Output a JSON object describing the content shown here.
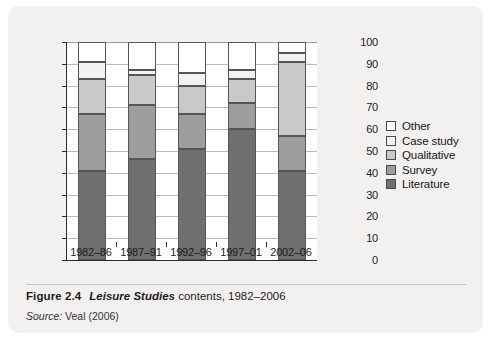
{
  "caption": {
    "number": "Figure 2.4",
    "title_italic": "Leisure Studies",
    "title_rest": " contents, 1982–2006",
    "source_label": "Source:",
    "source_text": " Veal (2006)"
  },
  "colors": {
    "other": "#ffffff",
    "case_study": "#f2f2f2",
    "qualitative": "#c9c9c9",
    "survey": "#9d9d9d",
    "literature": "#6f6f6f",
    "axis": "#2b2b2b",
    "grid": "#b9b9b9",
    "card_background": "#f2f1ef",
    "plot_background": "#ffffff"
  },
  "chart_data": {
    "type": "bar",
    "subtype": "stacked-vertical",
    "title": "Leisure Studies contents, 1982–2006",
    "xlabel": "",
    "ylabel": "",
    "ylim": [
      0,
      100
    ],
    "yticks": [
      0,
      10,
      20,
      30,
      40,
      50,
      60,
      70,
      80,
      90,
      100
    ],
    "ytick_labels": [
      "0",
      "10",
      "20",
      "30",
      "40",
      "50",
      "60",
      "70",
      "80",
      "90",
      "100"
    ],
    "grid": true,
    "grid_axis": "y",
    "legend_position": "right",
    "categories": [
      "1982–86",
      "1987–91",
      "1992–96",
      "1997–01",
      "2002–06"
    ],
    "series": [
      {
        "name": "Literature",
        "color": "#6f6f6f",
        "values": [
          41,
          46.5,
          51,
          60,
          41
        ]
      },
      {
        "name": "Survey",
        "color": "#9d9d9d",
        "values": [
          26,
          24.5,
          16,
          12,
          16
        ]
      },
      {
        "name": "Qualitative",
        "color": "#c9c9c9",
        "values": [
          16,
          14,
          13,
          11,
          34
        ]
      },
      {
        "name": "Case study",
        "color": "#f2f2f2",
        "values": [
          8,
          2,
          6,
          4,
          4
        ]
      },
      {
        "name": "Other",
        "color": "#ffffff",
        "values": [
          9,
          13,
          14,
          13,
          5
        ]
      }
    ],
    "cumulative_tops": {
      "1982–86": {
        "Literature": 41,
        "Survey": 67,
        "Qualitative": 83,
        "Case study": 91,
        "Other": 100
      },
      "1987–91": {
        "Literature": 46.5,
        "Survey": 71,
        "Qualitative": 85,
        "Case study": 87,
        "Other": 100
      },
      "1992–96": {
        "Literature": 51,
        "Survey": 67,
        "Qualitative": 80,
        "Case study": 86,
        "Other": 100
      },
      "1997–01": {
        "Literature": 60,
        "Survey": 72,
        "Qualitative": 83,
        "Case study": 87,
        "Other": 100
      },
      "2002–06": {
        "Literature": 41,
        "Survey": 57,
        "Qualitative": 91,
        "Case study": 95,
        "Other": 100
      }
    },
    "legend": [
      {
        "label": "Other",
        "color": "#ffffff"
      },
      {
        "label": "Case study",
        "color": "#f2f2f2"
      },
      {
        "label": "Qualitative",
        "color": "#c9c9c9"
      },
      {
        "label": "Survey",
        "color": "#9d9d9d"
      },
      {
        "label": "Literature",
        "color": "#6f6f6f"
      }
    ]
  }
}
